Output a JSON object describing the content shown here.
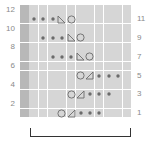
{
  "chart": {
    "type": "knitting-chart",
    "columns": 12,
    "rows": 12,
    "colors": {
      "cell": "#d6d6d6",
      "edge_column": "#b8b8b8",
      "gridline": "#ffffff",
      "symbol": "#6b6b6b",
      "label": "#8a8a8a",
      "bracket": "#333333"
    },
    "left_labels": [
      {
        "text": "12",
        "row": 12
      },
      {
        "text": "10",
        "row": 10
      },
      {
        "text": "8",
        "row": 8
      },
      {
        "text": "6",
        "row": 6
      },
      {
        "text": "4",
        "row": 4
      },
      {
        "text": "2",
        "row": 2
      }
    ],
    "right_labels": [
      {
        "text": "11",
        "row": 11
      },
      {
        "text": "9",
        "row": 9
      },
      {
        "text": "7",
        "row": 7
      },
      {
        "text": "5",
        "row": 5
      },
      {
        "text": "3",
        "row": 3
      },
      {
        "text": "1",
        "row": 1
      }
    ],
    "symbols": {
      "dot": "purl-dot-icon",
      "tri_left": "decrease-left-icon",
      "tri_right": "decrease-right-icon",
      "circle": "yarn-over-icon"
    },
    "rows_content": [
      {
        "row": 11,
        "cells": [
          {
            "col": 1,
            "sym": "dot"
          },
          {
            "col": 2,
            "sym": "dot"
          },
          {
            "col": 3,
            "sym": "dot"
          },
          {
            "col": 4,
            "sym": "tri_left"
          },
          {
            "col": 5,
            "sym": "circle"
          }
        ]
      },
      {
        "row": 9,
        "cells": [
          {
            "col": 2,
            "sym": "dot"
          },
          {
            "col": 3,
            "sym": "dot"
          },
          {
            "col": 4,
            "sym": "dot"
          },
          {
            "col": 5,
            "sym": "tri_left"
          },
          {
            "col": 6,
            "sym": "circle"
          }
        ]
      },
      {
        "row": 7,
        "cells": [
          {
            "col": 3,
            "sym": "dot"
          },
          {
            "col": 4,
            "sym": "dot"
          },
          {
            "col": 5,
            "sym": "dot"
          },
          {
            "col": 6,
            "sym": "tri_left"
          },
          {
            "col": 7,
            "sym": "circle"
          }
        ]
      },
      {
        "row": 5,
        "cells": [
          {
            "col": 6,
            "sym": "circle"
          },
          {
            "col": 7,
            "sym": "tri_right"
          },
          {
            "col": 8,
            "sym": "dot"
          },
          {
            "col": 9,
            "sym": "dot"
          },
          {
            "col": 10,
            "sym": "dot"
          }
        ]
      },
      {
        "row": 3,
        "cells": [
          {
            "col": 5,
            "sym": "circle"
          },
          {
            "col": 6,
            "sym": "tri_right"
          },
          {
            "col": 7,
            "sym": "dot"
          },
          {
            "col": 8,
            "sym": "dot"
          },
          {
            "col": 9,
            "sym": "dot"
          }
        ]
      },
      {
        "row": 1,
        "cells": [
          {
            "col": 4,
            "sym": "circle"
          },
          {
            "col": 5,
            "sym": "tri_right"
          },
          {
            "col": 6,
            "sym": "dot"
          },
          {
            "col": 7,
            "sym": "dot"
          },
          {
            "col": 8,
            "sym": "dot"
          }
        ]
      }
    ],
    "repeat_bracket": {
      "from_col": 1,
      "to_col": 11
    }
  }
}
